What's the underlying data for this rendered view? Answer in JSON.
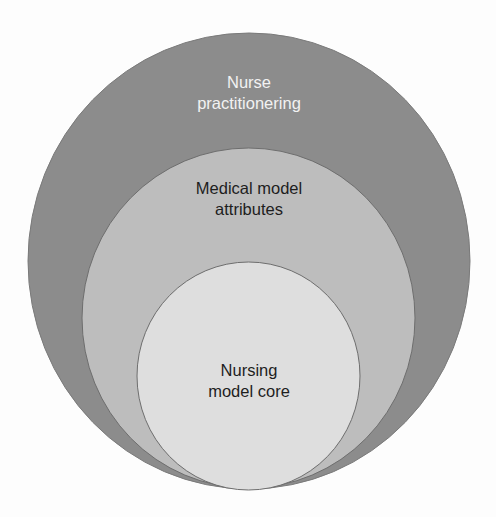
{
  "diagram": {
    "type": "nested-circles",
    "circles": [
      {
        "id": "outer",
        "label_lines": [
          "Nurse",
          "practitionering"
        ],
        "fill": "#8c8c8c",
        "text_color": "#f2f2f2"
      },
      {
        "id": "middle",
        "label_lines": [
          "Medical model",
          "attributes"
        ],
        "fill": "#bdbdbd",
        "text_color": "#1e1e1e"
      },
      {
        "id": "inner",
        "label_lines": [
          "Nursing",
          "model core"
        ],
        "fill": "#dedede",
        "text_color": "#1e1e1e"
      }
    ]
  }
}
